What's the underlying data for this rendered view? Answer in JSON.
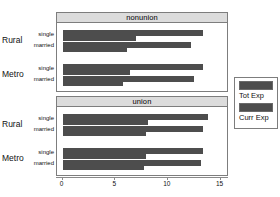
{
  "chart_data": {
    "type": "bar",
    "orientation": "horizontal",
    "title": "",
    "xlabel": "",
    "ylabel": "",
    "xlim": [
      0,
      15.8
    ],
    "xticks": [
      0,
      5,
      10,
      15
    ],
    "xtick_labels": [
      "0",
      "5",
      "10",
      "15"
    ],
    "grid": false,
    "legend": {
      "position": "right",
      "entries": [
        {
          "name": "Tot Exp",
          "color": "#4d4d4d"
        },
        {
          "name": "Curr Exp",
          "color": "#4d4d4d"
        }
      ]
    },
    "panels": [
      {
        "strip_label": "nonunion",
        "groups": [
          {
            "group": "Rural",
            "rows": [
              {
                "category": "single",
                "tot_exp": 13.3,
                "curr_exp": 7.0
              },
              {
                "category": "married",
                "tot_exp": 12.2,
                "curr_exp": 6.1
              }
            ]
          },
          {
            "group": "Metro",
            "rows": [
              {
                "category": "single",
                "tot_exp": 13.3,
                "curr_exp": 6.4
              },
              {
                "category": "married",
                "tot_exp": 12.5,
                "curr_exp": 5.7
              }
            ]
          }
        ]
      },
      {
        "strip_label": "union",
        "groups": [
          {
            "group": "Rural",
            "rows": [
              {
                "category": "single",
                "tot_exp": 13.8,
                "curr_exp": 8.1
              },
              {
                "category": "married",
                "tot_exp": 13.3,
                "curr_exp": 7.9
              }
            ]
          },
          {
            "group": "Metro",
            "rows": [
              {
                "category": "single",
                "tot_exp": 13.3,
                "curr_exp": 7.9
              },
              {
                "category": "married",
                "tot_exp": 13.1,
                "curr_exp": 7.7
              }
            ]
          }
        ]
      }
    ],
    "series": [
      {
        "name": "Tot Exp",
        "values": [
          13.3,
          12.2,
          13.3,
          12.5,
          13.8,
          13.3,
          13.3,
          13.1
        ]
      },
      {
        "name": "Curr Exp",
        "values": [
          7.0,
          6.1,
          6.4,
          5.7,
          8.1,
          7.9,
          7.9,
          7.7
        ]
      }
    ],
    "categories": [
      "nonunion / Rural / single",
      "nonunion / Rural / married",
      "nonunion / Metro / single",
      "nonunion / Metro / married",
      "union / Rural / single",
      "union / Rural / married",
      "union / Metro / single",
      "union / Metro / married"
    ],
    "colors": {
      "bar": "#4d4d4d",
      "strip": "#dcdcdc",
      "frame": "#7d7d7d",
      "background": "#ffffff"
    }
  }
}
